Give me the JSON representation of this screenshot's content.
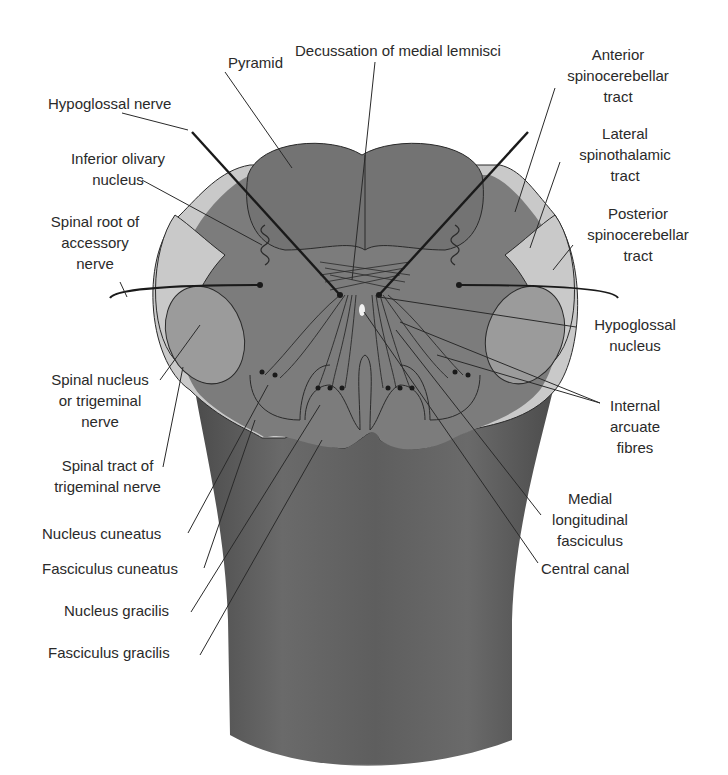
{
  "diagram": {
    "colors": {
      "background": "#ffffff",
      "brainstem_dark": "#5a5a5a",
      "section_fill": "#7d7d7d",
      "light_tract": "#c8c8c8",
      "nucleus_fill": "#9a9a9a",
      "line": "#2a2a2a",
      "text": "#2a2a2a"
    },
    "labels_left": [
      {
        "id": "pyramid",
        "lines": [
          "Pyramid"
        ]
      },
      {
        "id": "hypoglossal-nerve",
        "lines": [
          "Hypoglossal nerve"
        ]
      },
      {
        "id": "inferior-olivary-nucleus",
        "lines": [
          "Inferior olivary",
          "nucleus"
        ]
      },
      {
        "id": "spinal-root-accessory",
        "lines": [
          "Spinal root of",
          "accessory",
          "nerve"
        ]
      },
      {
        "id": "spinal-nucleus-trigeminal",
        "lines": [
          "Spinal nucleus",
          "or trigeminal",
          "nerve"
        ]
      },
      {
        "id": "spinal-tract-trigeminal",
        "lines": [
          "Spinal tract of",
          "trigeminal nerve"
        ]
      },
      {
        "id": "nucleus-cuneatus",
        "lines": [
          "Nucleus cuneatus"
        ]
      },
      {
        "id": "fasciculus-cuneatus",
        "lines": [
          "Fasciculus cuneatus"
        ]
      },
      {
        "id": "nucleus-gracilis",
        "lines": [
          "Nucleus gracilis"
        ]
      },
      {
        "id": "fasciculus-gracilis",
        "lines": [
          "Fasciculus gracilis"
        ]
      }
    ],
    "labels_right": [
      {
        "id": "decussation-medial-lemnisci",
        "lines": [
          "Decussation of medial lemnisci"
        ]
      },
      {
        "id": "anterior-spinocerebellar",
        "lines": [
          "Anterior",
          "spinocerebellar",
          "tract"
        ]
      },
      {
        "id": "lateral-spinothalamic",
        "lines": [
          "Lateral",
          "spinothalamic",
          "tract"
        ]
      },
      {
        "id": "posterior-spinocerebellar",
        "lines": [
          "Posterior",
          "spinocerebellar",
          "tract"
        ]
      },
      {
        "id": "hypoglossal-nucleus",
        "lines": [
          "Hypoglossal",
          "nucleus"
        ]
      },
      {
        "id": "internal-arcuate-fibres",
        "lines": [
          "Internal",
          "arcuate",
          "fibres"
        ]
      },
      {
        "id": "medial-longitudinal-fasciculus",
        "lines": [
          "Medial",
          "longitudinal",
          "fasciculus"
        ]
      },
      {
        "id": "central-canal",
        "lines": [
          "Central canal"
        ]
      }
    ]
  }
}
